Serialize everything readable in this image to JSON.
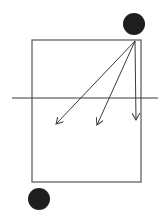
{
  "canvas": {
    "width": 168,
    "height": 219,
    "background": "#ffffff"
  },
  "colors": {
    "stroke": "#3a3a3a",
    "rect_stroke": "#555555",
    "dot_fill": "#1e1e1e"
  },
  "diagram": {
    "rectangle": {
      "x": 32,
      "y": 40,
      "width": 109,
      "height": 142
    },
    "horizontal_line": {
      "x1": 12,
      "y1": 98,
      "x2": 158,
      "y2": 98
    },
    "dots": [
      {
        "name": "top-right-dot",
        "cx": 134,
        "cy": 24,
        "r": 11
      },
      {
        "name": "bottom-left-dot",
        "cx": 39,
        "cy": 199,
        "r": 11
      }
    ],
    "arrow_origin": {
      "x": 135,
      "y": 41
    },
    "arrows": [
      {
        "name": "arrow-left",
        "x2": 56,
        "y2": 124
      },
      {
        "name": "arrow-middle",
        "x2": 97,
        "y2": 125
      },
      {
        "name": "arrow-vertical",
        "x2": 136,
        "y2": 120
      }
    ]
  }
}
